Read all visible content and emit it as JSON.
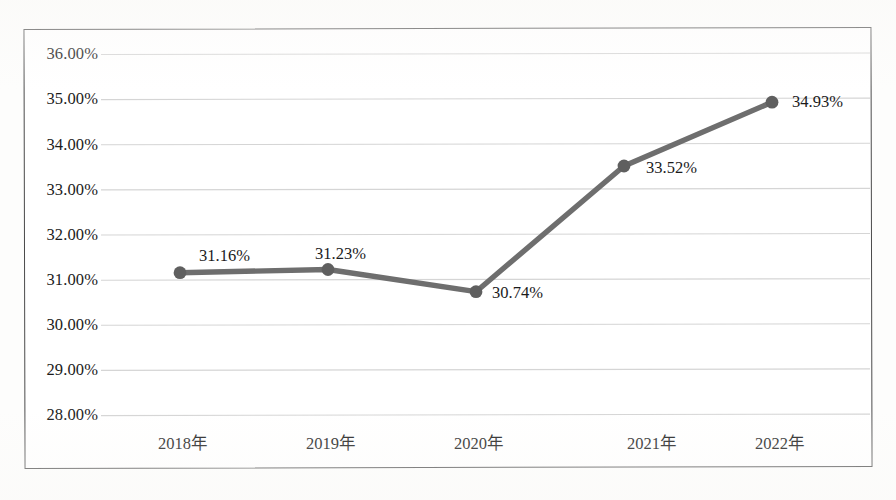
{
  "chart_data": {
    "type": "line",
    "title": "",
    "subtitle": "",
    "xlabel": "",
    "ylabel": "",
    "categories": [
      "2018年",
      "2019年",
      "2020年",
      "2021年",
      "2022年"
    ],
    "values": [
      31.16,
      31.23,
      30.74,
      33.52,
      34.93
    ],
    "point_labels": [
      "31.16%",
      "31.23%",
      "30.74%",
      "33.52%",
      "34.93%"
    ],
    "series": [
      {
        "name": "",
        "values": [
          31.16,
          31.23,
          30.74,
          33.52,
          34.93
        ]
      }
    ],
    "ylim": [
      28.0,
      36.0
    ],
    "ytick_values": [
      36.0,
      35.0,
      34.0,
      33.0,
      32.0,
      31.0,
      30.0,
      29.0,
      28.0
    ],
    "ytick_labels": [
      "36.00%",
      "35.00%",
      "34.00%",
      "33.00%",
      "32.00%",
      "31.00%",
      "30.00%",
      "29.00%",
      "28.00%"
    ],
    "grid": true,
    "grid_axis": "y",
    "legend": false,
    "legend_position": "none",
    "marker": "circle",
    "annotations": []
  },
  "style": {
    "line_color": "#6e6e6e",
    "marker_color": "#5f5f5f",
    "grid_color": "#d5d5d5",
    "frame_color": "#4a4a4a",
    "text_color": "#1b1b1b",
    "plot_background": "#ffffff",
    "page_background": "#fdfdfc"
  }
}
